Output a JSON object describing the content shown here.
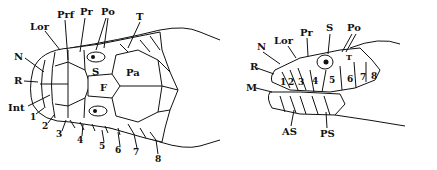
{
  "figure": {
    "panels": [
      {
        "id": "dorsal",
        "description": "Dorsal view of snake head scales",
        "labels": {
          "N": "N",
          "R": "R",
          "Int": "Int",
          "Lor": "Lor",
          "Prf": "Prf",
          "Pr": "Pr",
          "Po": "Po",
          "T": "T",
          "S": "S",
          "F": "F",
          "Pa": "Pa",
          "n1": "1",
          "n2": "2",
          "n3": "3",
          "n4": "4",
          "n5": "5",
          "n6": "6",
          "n7": "7",
          "n8": "8"
        }
      },
      {
        "id": "lateral",
        "description": "Lateral view of snake head scales",
        "labels": {
          "N": "N",
          "Lor": "Lor",
          "Pr": "Pr",
          "S": "S",
          "Po": "Po",
          "R": "R",
          "M": "M",
          "AS": "AS",
          "PS": "PS",
          "T": "T",
          "n1": "1",
          "n2": "2",
          "n3": "3",
          "n4": "4",
          "n5": "5",
          "n6": "6",
          "n7": "7",
          "n8": "8"
        }
      }
    ]
  }
}
